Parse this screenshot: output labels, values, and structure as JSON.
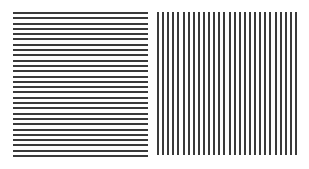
{
  "figure": {
    "left_panel": {
      "orientation": "horizontal",
      "line_count": 28,
      "x0": 13,
      "x1": 148,
      "y0": 13,
      "y1": 156,
      "color": "#3a3a3a"
    },
    "right_panel": {
      "orientation": "vertical",
      "line_count": 28,
      "x0": 158,
      "x1": 296,
      "y0": 12,
      "y1": 155,
      "color": "#3a3a3a"
    }
  }
}
